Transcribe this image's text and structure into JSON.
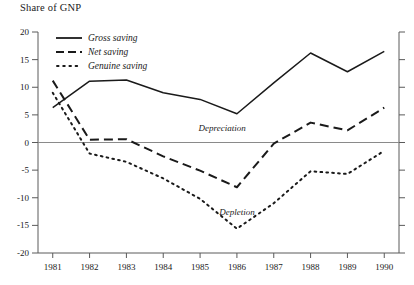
{
  "chart_data": {
    "type": "line",
    "title": "Share of GNP",
    "xlabel": "",
    "ylabel": "Share of GNP",
    "x": [
      1981,
      1982,
      1983,
      1984,
      1985,
      1986,
      1987,
      1988,
      1989,
      1990
    ],
    "categories": [
      "1981",
      "1982",
      "1983",
      "1984",
      "1985",
      "1986",
      "1987",
      "1988",
      "1989",
      "1990"
    ],
    "ylim": [
      -20,
      20
    ],
    "xlim": [
      1980.6,
      1990.4
    ],
    "yticks": [
      20,
      15,
      10,
      5,
      0,
      -5,
      -10,
      -15,
      -20
    ],
    "ytick_labels": [
      "20",
      "15",
      "10",
      "5",
      "0",
      "-5",
      "-10",
      "-15",
      "-20"
    ],
    "grid": false,
    "zero_line": true,
    "legend_position": "top-left",
    "series": [
      {
        "name": "Gross saving",
        "style": "solid",
        "color": "#1a1a1a",
        "values": [
          6.3,
          11.1,
          11.3,
          9.0,
          7.8,
          5.2,
          10.8,
          16.2,
          12.8,
          16.5
        ]
      },
      {
        "name": "Net saving",
        "style": "dashed",
        "color": "#1a1a1a",
        "values": [
          11.2,
          0.5,
          0.6,
          -2.5,
          -5.1,
          -8.1,
          -0.2,
          3.6,
          2.2,
          6.3
        ]
      },
      {
        "name": "Genuine saving",
        "style": "dotted",
        "color": "#1a1a1a",
        "values": [
          9.0,
          -2.0,
          -3.5,
          -6.5,
          -10.2,
          -15.6,
          -11.0,
          -5.2,
          -5.7,
          -1.5
        ]
      }
    ],
    "annotations": [
      {
        "text": "Depreciation",
        "x": 1985.6,
        "y": 2.6
      },
      {
        "text": "Depletion",
        "x": 1986.0,
        "y": -12.6
      }
    ]
  }
}
